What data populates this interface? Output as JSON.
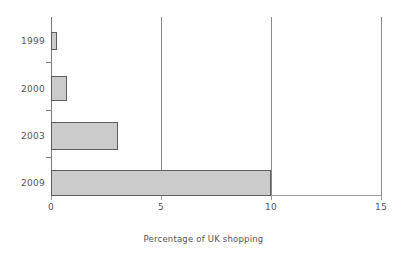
{
  "chart_data": {
    "type": "bar",
    "orientation": "horizontal",
    "title": "",
    "xlabel": "Percentage of UK shopping",
    "ylabel": "",
    "categories": [
      "1999",
      "2000",
      "2003",
      "2009"
    ],
    "values": [
      0.25,
      0.7,
      3.0,
      10.0
    ],
    "series": [
      {
        "name": "Percentage of UK shopping",
        "values": [
          0.25,
          0.7,
          3.0,
          10.0
        ]
      }
    ],
    "xlim": [
      0,
      15
    ],
    "xticks": [
      0,
      5,
      10,
      15
    ],
    "xtick_labels": [
      "0",
      "5",
      "10",
      "15"
    ],
    "ytick_labels": [
      "1999",
      "2000",
      "2003",
      "2009"
    ],
    "grid": "vertical-only",
    "legend": "none",
    "colors": {
      "bar_fill": "#cbcbcb",
      "bar_border": "#5e5e5e",
      "axis": "#7a7a7a",
      "gridline": "#8a8a8a",
      "text": "#555555",
      "background": "#ffffff"
    }
  },
  "bars": [
    {
      "label": "1999",
      "value": 0.25,
      "left": 51,
      "top": 32,
      "width": 6,
      "height": 18,
      "label_top": 36
    },
    {
      "label": "2000",
      "value": 0.7,
      "left": 51,
      "top": 76,
      "width": 16,
      "height": 25,
      "label_top": 84
    },
    {
      "label": "2003",
      "value": 3.0,
      "left": 51,
      "top": 122,
      "width": 67,
      "height": 28,
      "label_top": 131
    },
    {
      "label": "2009",
      "value": 10.0,
      "left": 51,
      "top": 170,
      "width": 220,
      "height": 26,
      "label_top": 178
    }
  ],
  "ytick_marks": [
    {
      "top": 62
    },
    {
      "top": 110
    },
    {
      "top": 157
    }
  ],
  "xticks": [
    {
      "label": "0",
      "x": 51
    },
    {
      "label": "5",
      "x": 161
    },
    {
      "label": "10",
      "x": 271
    },
    {
      "label": "15",
      "x": 381
    }
  ],
  "gridlines": [
    {
      "x": 161
    },
    {
      "x": 271
    },
    {
      "x": 381
    }
  ],
  "axis_title": "Percentage of UK shopping"
}
